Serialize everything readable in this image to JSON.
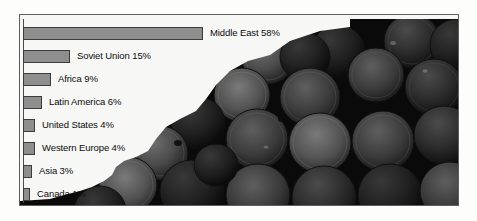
{
  "figure": {
    "kind": "horizontal-bar-chart-over-photo",
    "photo_subject": "stacked oil barrels",
    "frame_border_color": "#5d5d5d",
    "plate_color": "#f7f7f5",
    "outer_background": "#fdfdfc"
  },
  "chart_data": {
    "type": "bar",
    "orientation": "horizontal",
    "title": "",
    "subtitle": "",
    "xlabel": "",
    "ylabel": "",
    "xlim": [
      0,
      58
    ],
    "grid": false,
    "legend": "none",
    "value_suffix": "%",
    "categories": [
      "Middle East",
      "Soviet Union",
      "Africa",
      "Latin America",
      "United States",
      "Western Europe",
      "Asia",
      "Canada"
    ],
    "values": [
      58,
      15,
      9,
      6,
      4,
      4,
      3,
      1
    ],
    "labels": [
      "Middle East 58%",
      "Soviet Union 15%",
      "Africa 9%",
      "Latin America 6%",
      "United States 4%",
      "Western Europe 4%",
      "Asia 3%",
      "Canada 1%"
    ],
    "bar_fill_color": "#8e8e8e",
    "bar_border_color": "#3c3c3c",
    "label_color": "#0c0c0c"
  }
}
